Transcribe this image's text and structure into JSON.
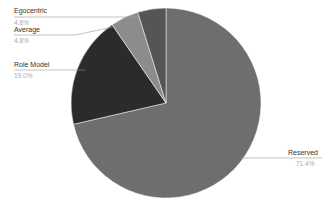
{
  "chart_data": {
    "type": "pie",
    "title": "",
    "categories": [
      "Reserved",
      "Role Model",
      "Average",
      "Egocentric"
    ],
    "values": [
      71.4,
      19.0,
      4.8,
      4.8
    ],
    "labels": [
      "71.4%",
      "19.0%",
      "4.8%",
      "4.8%"
    ],
    "colors": [
      "#6e6e6e",
      "#2b2b2b",
      "#8c8c8c",
      "#555555"
    ],
    "start_angle": "top, clockwise",
    "legend": "none (callout labels)"
  },
  "labels": {
    "reserved": {
      "name": "Reserved",
      "pct": "71.4%"
    },
    "role_model": {
      "name": "Role Model",
      "pct": "19.0%"
    },
    "average": {
      "name": "Average",
      "pct": "4.8%"
    },
    "egocentric": {
      "name": "Egocentric",
      "pct": "4.8%"
    }
  }
}
